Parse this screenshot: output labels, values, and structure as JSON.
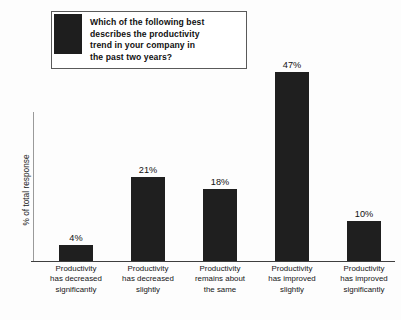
{
  "title": {
    "lines": [
      "Which of the following best",
      "describes the productivity",
      "trend in your company in",
      "the past two years?"
    ],
    "swatch_name": "legend-swatch",
    "swatch_color": "#1e1e1e"
  },
  "axes": {
    "ylabel": "% of total response",
    "xlabel": ""
  },
  "chart_data": {
    "type": "bar",
    "title": "Which of the following best describes the productivity trend in your company in the past two years?",
    "xlabel": "",
    "ylabel": "% of total response",
    "ylim": [
      0,
      50
    ],
    "grid": false,
    "legend": "none",
    "bar_color": "#1f1f1f",
    "categories": [
      "Productivity has decreased significantly",
      "Productivity has decreased slightly",
      "Productivity remains about the same",
      "Productivity has improved slightly",
      "Productivity has improved significantly"
    ],
    "category_lines": [
      [
        "Productivity",
        "has decreased",
        "significantly"
      ],
      [
        "Productivity",
        "has decreased",
        "slightly"
      ],
      [
        "Productivity",
        "remains about",
        "the same"
      ],
      [
        "Productivity",
        "has improved",
        "slightly"
      ],
      [
        "Productivity",
        "has improved",
        "significantly"
      ]
    ],
    "values": [
      4,
      21,
      18,
      47,
      10
    ],
    "value_labels": [
      "4%",
      "21%",
      "18%",
      "47%",
      "10%"
    ]
  }
}
